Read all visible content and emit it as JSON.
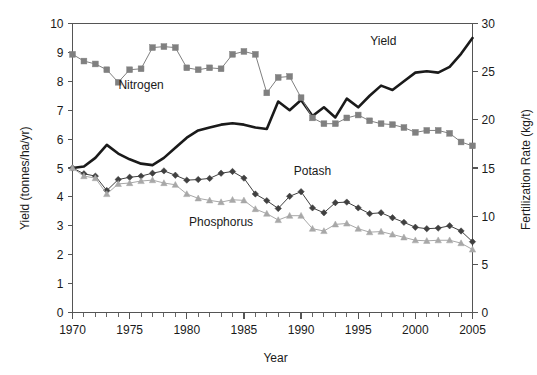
{
  "chart_data": {
    "type": "line",
    "title": "",
    "xlabel": "Year",
    "ylabel": "Yield (tonnes/ha/yr)",
    "ylabel_right": "Fertilization Rate (kg/t)",
    "xlim": [
      1970,
      2005
    ],
    "ylim": [
      0,
      10
    ],
    "ylim_right": [
      0,
      30
    ],
    "xticks": [
      1970,
      1975,
      1980,
      1985,
      1990,
      1995,
      2000,
      2005
    ],
    "xtick_labels": [
      "1970",
      "1975",
      "1980",
      "1985",
      "1990",
      "1995",
      "2000",
      "2005"
    ],
    "xtick_minor_step": 1,
    "yticks": [
      0,
      1,
      2,
      3,
      4,
      5,
      6,
      7,
      8,
      9,
      10
    ],
    "ytick_labels": [
      "0",
      "1",
      "2",
      "3",
      "4",
      "5",
      "6",
      "7",
      "8",
      "9",
      "10"
    ],
    "yticks_right": [
      0,
      5,
      10,
      15,
      20,
      25,
      30
    ],
    "ytick_labels_right": [
      "0",
      "5",
      "10",
      "15",
      "20",
      "25",
      "30"
    ],
    "grid": false,
    "legend_position": "inline-annotations",
    "x": [
      1970,
      1971,
      1972,
      1973,
      1974,
      1975,
      1976,
      1977,
      1978,
      1979,
      1980,
      1981,
      1982,
      1983,
      1984,
      1985,
      1986,
      1987,
      1988,
      1989,
      1990,
      1991,
      1992,
      1993,
      1994,
      1995,
      1996,
      1997,
      1998,
      1999,
      2000,
      2001,
      2002,
      2003,
      2004,
      2005
    ],
    "series": [
      {
        "name": "Yield",
        "axis": "left",
        "unit": "tonnes/ha/yr",
        "color": "#1a1a1a",
        "marker": "none",
        "line_width": 2.6,
        "values": [
          5.0,
          5.05,
          5.35,
          5.8,
          5.5,
          5.3,
          5.15,
          5.1,
          5.35,
          5.7,
          6.05,
          6.3,
          6.4,
          6.5,
          6.55,
          6.5,
          6.4,
          6.35,
          7.3,
          7.0,
          7.35,
          6.8,
          7.1,
          6.75,
          7.4,
          7.1,
          7.5,
          7.85,
          7.7,
          8.0,
          8.3,
          8.35,
          8.3,
          8.5,
          8.95,
          9.5
        ]
      },
      {
        "name": "Nitrogen",
        "axis": "right",
        "unit": "kg/t",
        "color": "#808080",
        "marker": "square",
        "line_width": 1.0,
        "values": [
          26.8,
          26.1,
          25.8,
          25.2,
          23.9,
          25.2,
          25.3,
          27.5,
          27.6,
          27.5,
          25.4,
          25.2,
          25.4,
          25.3,
          26.8,
          27.1,
          26.8,
          22.8,
          24.4,
          24.5,
          22.3,
          20.2,
          19.6,
          19.6,
          20.2,
          20.5,
          19.9,
          19.6,
          19.5,
          19.2,
          18.7,
          18.9,
          18.9,
          18.6,
          17.7,
          17.3
        ]
      },
      {
        "name": "Potash",
        "axis": "left",
        "unit": "tonnes/ha/yr",
        "color": "#404040",
        "marker": "diamond",
        "line_width": 1.0,
        "values": [
          5.0,
          4.8,
          4.72,
          4.22,
          4.6,
          4.68,
          4.72,
          4.82,
          4.9,
          4.75,
          4.58,
          4.6,
          4.64,
          4.82,
          4.88,
          4.65,
          4.1,
          3.87,
          3.6,
          4.02,
          4.18,
          3.62,
          3.45,
          3.8,
          3.82,
          3.62,
          3.42,
          3.45,
          3.28,
          3.12,
          2.95,
          2.9,
          2.92,
          3.0,
          2.82,
          2.45
        ]
      },
      {
        "name": "Phosphorus",
        "axis": "left",
        "unit": "tonnes/ha/yr",
        "color": "#a8a8a8",
        "marker": "triangle",
        "line_width": 1.0,
        "values": [
          5.0,
          4.72,
          4.65,
          4.1,
          4.45,
          4.48,
          4.55,
          4.58,
          4.48,
          4.42,
          4.1,
          3.95,
          3.88,
          3.82,
          3.9,
          3.88,
          3.58,
          3.42,
          3.2,
          3.35,
          3.35,
          2.9,
          2.82,
          3.05,
          3.08,
          2.9,
          2.78,
          2.8,
          2.7,
          2.6,
          2.5,
          2.48,
          2.5,
          2.5,
          2.4,
          2.18
        ]
      }
    ],
    "annotations": [
      {
        "text": "Yield",
        "x": 1997.2,
        "y": 9.25,
        "series": "Yield"
      },
      {
        "text": "Nitrogen",
        "x": 1976.0,
        "y": 7.75,
        "series": "Nitrogen"
      },
      {
        "text": "Potash",
        "x": 1991.0,
        "y": 4.75,
        "series": "Potash"
      },
      {
        "text": "Phosphorus",
        "x": 1983.0,
        "y": 3.0,
        "series": "Phosphorus"
      }
    ]
  }
}
